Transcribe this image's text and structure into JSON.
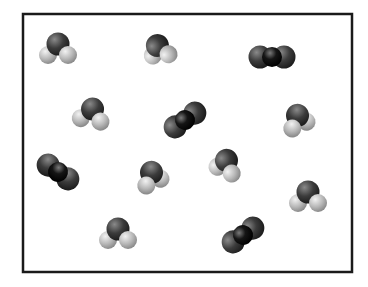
{
  "diagram": {
    "title": "",
    "box": {
      "x": 23,
      "y": 14,
      "width": 329,
      "height": 258,
      "stroke": "#1a1a1a",
      "stroke_width": 2.5,
      "fill": "#ffffff"
    },
    "colors": {
      "oxygen": "#3c3c3c",
      "oxygen_highlight": "#8a8a8a",
      "carbon": "#111111",
      "carbon_highlight": "#6a6a6a",
      "hydrogen": "#b8b8b8",
      "hydrogen_highlight": "#f2f2f2"
    },
    "molecules": [
      {
        "type": "H2O",
        "x": 58,
        "y": 47,
        "angle": 0,
        "h_side": "down"
      },
      {
        "type": "H2O",
        "x": 160,
        "y": 47,
        "angle": -60,
        "h_side": "left"
      },
      {
        "type": "CO2",
        "x": 272,
        "y": 57,
        "angle": 0
      },
      {
        "type": "H2O",
        "x": 92,
        "y": 112,
        "angle": 10,
        "h_side": "down"
      },
      {
        "type": "CO2",
        "x": 185,
        "y": 120,
        "angle": -35
      },
      {
        "type": "H2O",
        "x": 296,
        "y": 118,
        "angle": 30,
        "h_side": "right"
      },
      {
        "type": "CO2",
        "x": 58,
        "y": 172,
        "angle": 35
      },
      {
        "type": "H2O",
        "x": 150,
        "y": 175,
        "angle": 30,
        "h_side": "right"
      },
      {
        "type": "H2O",
        "x": 228,
        "y": 163,
        "angle": -30,
        "h_side": "left"
      },
      {
        "type": "H2O",
        "x": 308,
        "y": 195,
        "angle": 0,
        "h_side": "down"
      },
      {
        "type": "H2O",
        "x": 118,
        "y": 232,
        "angle": 0,
        "h_side": "down"
      },
      {
        "type": "CO2",
        "x": 243,
        "y": 235,
        "angle": -35
      }
    ],
    "counts": {
      "H2O": 8,
      "CO2": 4
    }
  }
}
